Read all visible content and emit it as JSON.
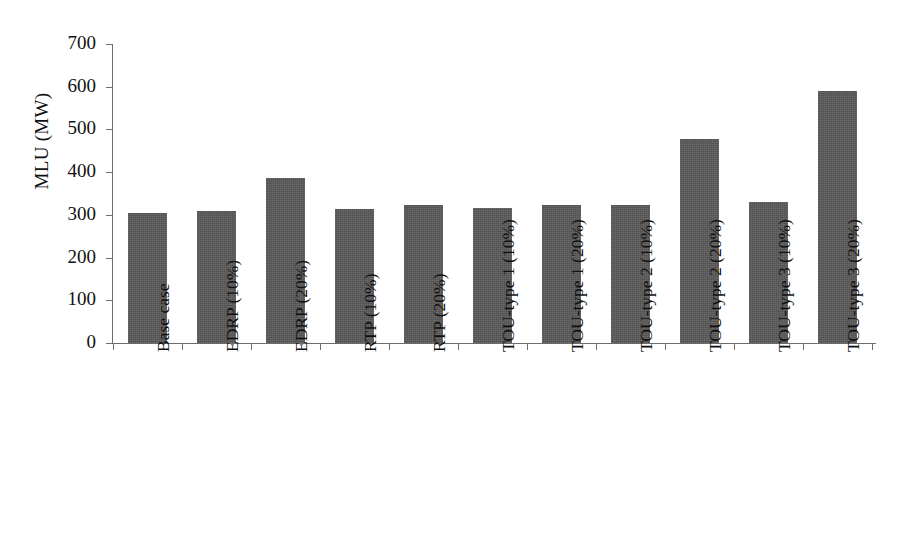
{
  "chart_data": {
    "type": "bar",
    "title": "",
    "xlabel": "",
    "ylabel": "MLU (MW)",
    "ylim": [
      0,
      700
    ],
    "ytick_labels": [
      "700",
      "600",
      "500",
      "400",
      "300",
      "200",
      "100",
      "0"
    ],
    "ytick_values": [
      700,
      600,
      500,
      400,
      300,
      200,
      100,
      0
    ],
    "grid": false,
    "legend": "none",
    "bar_color": "#595959",
    "axis_color": "#6d6d6d",
    "categories": [
      "Base case",
      "EDRP (10%)",
      "EDRP (20%)",
      "RTP (10%)",
      "RTP (20%)",
      "TOU-type 1 (10%)",
      "TOU-type 1 (20%)",
      "TOU-type 2 (10%)",
      "TOU-type 2 (20%)",
      "TOU-type 3 (10%)",
      "TOU-type 3 (20%)"
    ],
    "values": [
      305,
      310,
      386,
      313,
      322,
      315,
      323,
      324,
      477,
      330,
      590
    ]
  }
}
